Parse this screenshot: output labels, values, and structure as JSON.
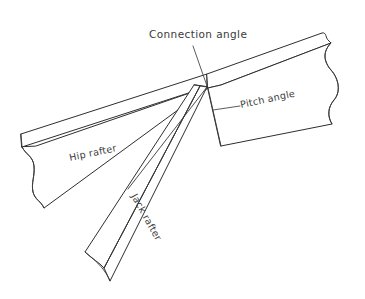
{
  "figure": {
    "background_color": "#ffffff",
    "line_color": "#2e2e2e",
    "text_color": "#3b3b3b",
    "width": 365,
    "height": 299
  },
  "labels": {
    "connection_angle": "Connection angle",
    "pitch_angle": "Pitch angle",
    "hip_rafter": "Hip rafter",
    "jack_rafter": "Jack rafter"
  },
  "label_geometry": {
    "connection_angle": {
      "x": 149,
      "y": 38,
      "rotation": 0
    },
    "pitch_angle": {
      "x": 239,
      "y": 110,
      "rotation": -12
    },
    "hip_rafter": {
      "x": 70,
      "y": 161,
      "rotation": -12
    },
    "jack_rafter": {
      "x": 131,
      "y": 196,
      "rotation": 61
    }
  },
  "parts": [
    {
      "name": "hip-rafter",
      "label": "Hip rafter",
      "type": "beam",
      "break_ends": [
        "left",
        "right"
      ]
    },
    {
      "name": "jack-rafter",
      "label": "Jack rafter",
      "type": "beam",
      "break_ends": [
        "bottom"
      ]
    }
  ],
  "annotations": [
    {
      "name": "connection-angle",
      "label": "Connection angle",
      "leader": "line from text down-right to joint apex"
    },
    {
      "name": "pitch-angle",
      "label": "Pitch angle",
      "leader": "short horizontal dash to left of text"
    }
  ]
}
